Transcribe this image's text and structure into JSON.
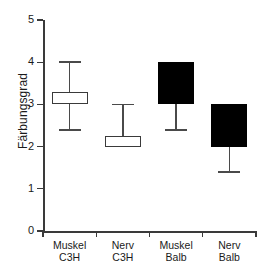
{
  "chart_data": {
    "type": "bar",
    "subtype": "box-plot",
    "title": "",
    "xlabel": "",
    "ylabel": "Färbungsgrad",
    "ylim": [
      0,
      5
    ],
    "yticks": [
      "0",
      "1",
      "2",
      "3",
      "4",
      "5"
    ],
    "grid": false,
    "legend": false,
    "categories": [
      "Muskel C3H",
      "Nerv C3H",
      "Muskel Balb",
      "Nerv Balb"
    ],
    "category_lines": [
      [
        "Muskel",
        "C3H"
      ],
      [
        "Nerv",
        "C3H"
      ],
      [
        "Muskel",
        "Balb"
      ],
      [
        "Nerv",
        "Balb"
      ]
    ],
    "series": [
      {
        "name": "Muskel C3H",
        "fill": "open",
        "box_low": 3.0,
        "box_high": 3.3,
        "whisker_low": 2.4,
        "whisker_high": 4.0
      },
      {
        "name": "Nerv C3H",
        "fill": "open",
        "box_low": 2.0,
        "box_high": 2.25,
        "whisker_low": 2.0,
        "whisker_high": 3.0
      },
      {
        "name": "Muskel Balb",
        "fill": "filled",
        "box_low": 3.0,
        "box_high": 4.0,
        "whisker_low": 2.4,
        "whisker_high": 4.0
      },
      {
        "name": "Nerv Balb",
        "fill": "filled",
        "box_low": 2.0,
        "box_high": 3.0,
        "whisker_low": 1.4,
        "whisker_high": 3.0
      }
    ],
    "colors": {
      "axis": "#3a3a3a",
      "open_box_fill": "#ffffff",
      "filled_box_fill": "#000000",
      "whisker": "#4a4a4a"
    }
  }
}
